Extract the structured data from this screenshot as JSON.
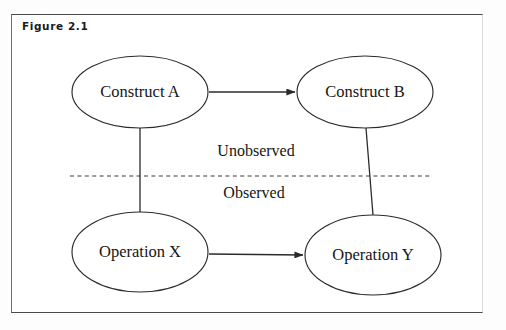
{
  "figure": {
    "label": "Figure 2.1",
    "frame_color": "#4a4a4a",
    "background": "#ffffff"
  },
  "diagram": {
    "type": "construct-operation-diagram",
    "stroke_color": "#2b2b2b",
    "nodes": [
      {
        "id": "construct-a",
        "label": "Construct A",
        "shape": "ellipse",
        "cx": 140,
        "cy": 92,
        "rx": 68,
        "ry": 36,
        "region": "Unobserved"
      },
      {
        "id": "construct-b",
        "label": "Construct B",
        "shape": "ellipse",
        "cx": 365,
        "cy": 92,
        "rx": 68,
        "ry": 36,
        "region": "Unobserved"
      },
      {
        "id": "operation-x",
        "label": "Operation X",
        "shape": "ellipse",
        "cx": 140,
        "cy": 252,
        "rx": 68,
        "ry": 40,
        "region": "Observed"
      },
      {
        "id": "operation-y",
        "label": "Operation Y",
        "shape": "ellipse",
        "cx": 373,
        "cy": 255,
        "rx": 68,
        "ry": 40,
        "region": "Observed"
      }
    ],
    "edges": [
      {
        "id": "a-to-b",
        "from": "construct-a",
        "to": "construct-b",
        "style": "arrow",
        "direction": "right"
      },
      {
        "id": "x-to-y",
        "from": "operation-x",
        "to": "operation-y",
        "style": "arrow",
        "direction": "right"
      },
      {
        "id": "a-to-x",
        "from": "construct-a",
        "to": "operation-x",
        "style": "line",
        "direction": "none"
      },
      {
        "id": "b-to-y",
        "from": "construct-b",
        "to": "operation-y",
        "style": "line",
        "direction": "none"
      }
    ],
    "divider": {
      "id": "observation-divider",
      "style": "dashed",
      "y": 176,
      "x_start": 70,
      "x_end": 430
    },
    "region_labels": [
      {
        "id": "unobserved",
        "label": "Unobserved",
        "x": 256,
        "y": 152
      },
      {
        "id": "observed",
        "label": "Observed",
        "x": 254,
        "y": 194
      }
    ]
  }
}
